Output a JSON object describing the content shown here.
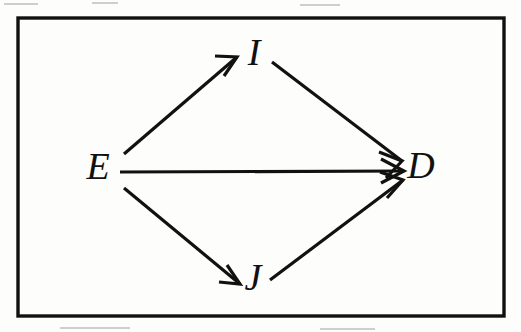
{
  "figure": {
    "kind": "directed-acyclic-graph",
    "title": "",
    "background_color": "#fdfdfb",
    "ink_color": "#111111",
    "frame": {
      "label": "diagram-border",
      "x": 18,
      "y": 18,
      "width": 486,
      "height": 298,
      "stroke_color": "#111111",
      "stroke_width": 3.4
    },
    "nodes": [
      {
        "id": "E",
        "label": "E",
        "x": 98,
        "y": 170,
        "role": "exposure"
      },
      {
        "id": "I",
        "label": "I",
        "x": 254,
        "y": 56,
        "role": "mediator-upper"
      },
      {
        "id": "J",
        "label": "J",
        "x": 253,
        "y": 281,
        "role": "mediator-lower"
      },
      {
        "id": "D",
        "label": "D",
        "x": 421,
        "y": 169,
        "role": "outcome"
      }
    ],
    "edges": [
      {
        "id": "E-I",
        "from": "E",
        "to": "I",
        "label": "",
        "x1": 124,
        "y1": 154,
        "x2": 237,
        "y2": 57
      },
      {
        "id": "E-D",
        "from": "E",
        "to": "D",
        "label": "",
        "x1": 120,
        "y1": 172,
        "x2": 404,
        "y2": 171
      },
      {
        "id": "E-J",
        "from": "E",
        "to": "J",
        "label": "",
        "x1": 124,
        "y1": 188,
        "x2": 240,
        "y2": 284
      },
      {
        "id": "I-D",
        "from": "I",
        "to": "D",
        "label": "",
        "x1": 272,
        "y1": 62,
        "x2": 402,
        "y2": 161
      },
      {
        "id": "J-D",
        "from": "J",
        "to": "D",
        "label": "",
        "x1": 270,
        "y1": 280,
        "x2": 403,
        "y2": 180
      }
    ]
  }
}
